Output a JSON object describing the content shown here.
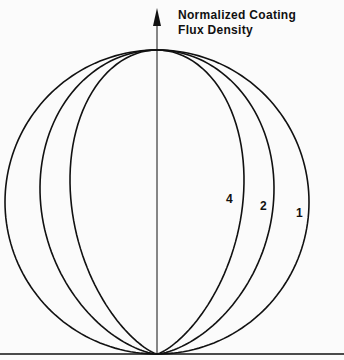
{
  "chart_data": {
    "type": "polar-line",
    "title": "Normalized Coating Flux Density",
    "axis_label_line1": "Normalized Coating",
    "axis_label_line2": "Flux Density",
    "formula": "r = cos^n(theta)",
    "series": [
      {
        "name": "1",
        "exponent": 1,
        "label_x": 296,
        "label_y": 206
      },
      {
        "name": "2",
        "exponent": 2,
        "label_x": 260,
        "label_y": 199
      },
      {
        "name": "4",
        "exponent": 4,
        "label_x": 226,
        "label_y": 192
      }
    ],
    "origin": {
      "x": 157,
      "y": 354
    },
    "max_r_px": 304,
    "grid": false
  }
}
